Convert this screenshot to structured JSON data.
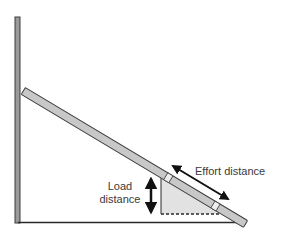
{
  "diagram": {
    "labels": {
      "effort": "Effort distance",
      "load_line1": "Load",
      "load_line2": "distance"
    },
    "colors": {
      "plank_fill": "#c8c8c8",
      "plank_stroke": "#3c3c3c",
      "post_fill": "#9a9a9a",
      "triangle_fill": "#e2e2e2",
      "arrow": "#111111",
      "text": "#3a3a3a"
    }
  }
}
